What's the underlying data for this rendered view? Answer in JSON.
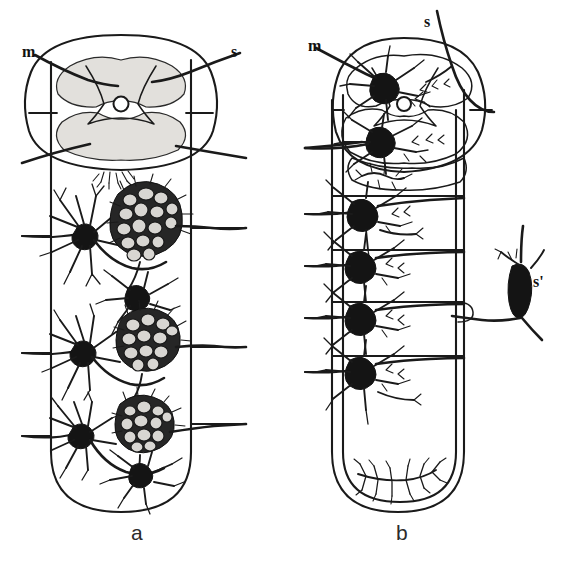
{
  "figure": {
    "type": "scientific-illustration",
    "background_color": "#ffffff",
    "ink_color": "#1a1a1a",
    "width": 567,
    "height": 566
  },
  "panels": [
    {
      "id": "a",
      "caption": "a",
      "caption_pos": {
        "x": 131,
        "y": 522
      },
      "labels": [
        {
          "id": "m",
          "text": "m",
          "meaning": "motor-fibre",
          "x": 22,
          "y": 44
        },
        {
          "id": "s",
          "text": "s",
          "meaning": "sensory-fibre",
          "x": 231,
          "y": 44
        }
      ],
      "segments": 4,
      "neuron_count": 9
    },
    {
      "id": "b",
      "caption": "b",
      "caption_pos": {
        "x": 396,
        "y": 522
      },
      "labels": [
        {
          "id": "m",
          "text": "m",
          "meaning": "motor-fibre",
          "x": 308,
          "y": 38
        },
        {
          "id": "s",
          "text": "s",
          "meaning": "sensory-fibre",
          "x": 424,
          "y": 14
        },
        {
          "id": "s-prime",
          "text": "s'",
          "meaning": "peripheral-sensory-cell",
          "x": 533,
          "y": 274
        }
      ],
      "segments": 5,
      "neuron_count": 9
    }
  ]
}
